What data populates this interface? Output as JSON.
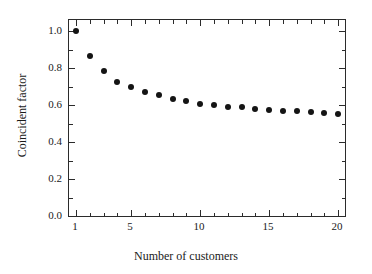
{
  "chart_data": {
    "type": "scatter",
    "title": "",
    "xlabel": "Number of customers",
    "ylabel": "Coincident factor",
    "xlim": [
      0.5,
      20.5
    ],
    "ylim": [
      0.0,
      1.06
    ],
    "grid": false,
    "legend": null,
    "marker": "filled-circle",
    "marker_color": "#141414",
    "frame": "box-all-sides",
    "tick_direction": "in",
    "x": [
      1,
      2,
      3,
      4,
      5,
      6,
      7,
      8,
      9,
      10,
      11,
      12,
      13,
      14,
      15,
      16,
      17,
      18,
      19,
      20
    ],
    "values": [
      1.0,
      0.866,
      0.782,
      0.727,
      0.697,
      0.672,
      0.653,
      0.635,
      0.62,
      0.608,
      0.6,
      0.592,
      0.587,
      0.58,
      0.575,
      0.57,
      0.566,
      0.562,
      0.558,
      0.553
    ],
    "xticks_major": [
      1,
      5,
      10,
      15,
      20
    ],
    "xticks_major_labels": [
      "1",
      "5",
      "10",
      "15",
      "20"
    ],
    "xticks_minor": [
      2,
      3,
      4,
      6,
      7,
      8,
      9,
      11,
      12,
      13,
      14,
      16,
      17,
      18,
      19
    ],
    "yticks_major": [
      0.0,
      0.2,
      0.4,
      0.6,
      0.8,
      1.0
    ],
    "yticks_major_labels": [
      "0.0",
      "0.2",
      "0.4",
      "0.6",
      "0.8",
      "1.0"
    ],
    "yticks_minor": [
      0.1,
      0.3,
      0.5,
      0.7,
      0.9
    ],
    "axis_color": "#2b2b2b",
    "background_color": "#ffffff"
  }
}
